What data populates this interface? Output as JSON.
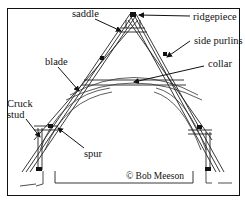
{
  "diagram": {
    "title_fragment": "",
    "labels": {
      "saddle": "saddle",
      "ridgepiece": "ridgepiece",
      "side_purlins": "side purlins",
      "blade": "blade",
      "collar": "collar",
      "cruck_line1": "Cruck",
      "cruck_line2": "stud",
      "spur": "spur"
    },
    "copyright": "© Bob Meeson",
    "colors": {
      "ink": "#111111",
      "background": "#ffffff"
    }
  }
}
